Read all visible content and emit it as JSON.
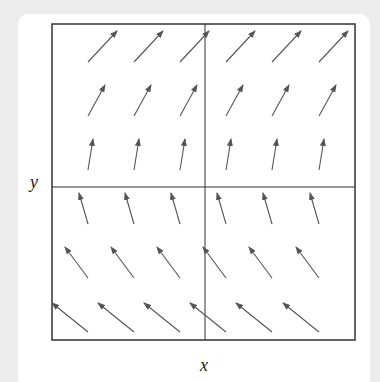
{
  "figure": {
    "x_label": "x",
    "y_label": "y",
    "colors": {
      "frame": "#333333",
      "arrow": "#555555",
      "background": "#ececec",
      "card": "#ffffff"
    },
    "frame": {
      "x0": 52,
      "y0": 24,
      "x1": 355,
      "y1": 340
    },
    "axes_cross": {
      "x": 205,
      "y": 187
    },
    "columns_tail_x": [
      88,
      134,
      180,
      226,
      272,
      319
    ],
    "rows": [
      {
        "tail_y": 62,
        "head_y": 31,
        "dx": 29
      },
      {
        "tail_y": 116,
        "head_y": 85,
        "dx": 17
      },
      {
        "tail_y": 170,
        "head_y": 139,
        "dx": 5
      },
      {
        "tail_y": 224,
        "head_y": 193,
        "dx": -9
      },
      {
        "tail_y": 278,
        "head_y": 247,
        "dx": -23
      },
      {
        "tail_y": 332,
        "head_y": 303,
        "dx": -36
      }
    ]
  }
}
